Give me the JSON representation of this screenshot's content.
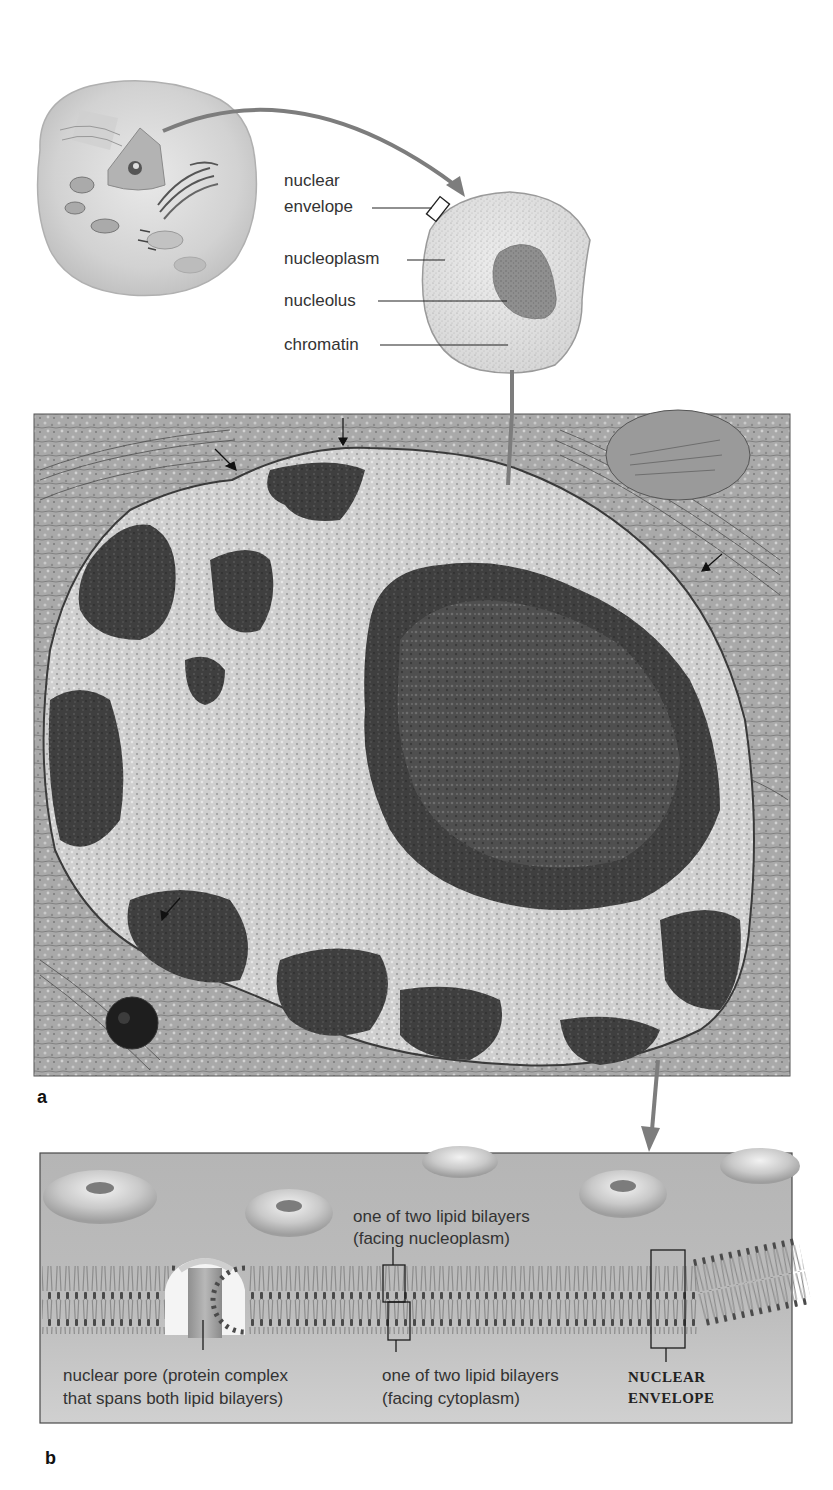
{
  "figure": {
    "panel_a_letter": "a",
    "panel_b_letter": "b",
    "top_diagram": {
      "labels": {
        "nuclear_line1": "nuclear",
        "nuclear_line2": "envelope",
        "nucleoplasm": "nucleoplasm",
        "nucleolus": "nucleolus",
        "chromatin": "chromatin"
      }
    },
    "micrograph": {
      "description": "transmission electron micrograph of cell nucleus"
    },
    "envelope_diagram": {
      "labels": {
        "inner_bilayer_line1": "one of two lipid bilayers",
        "inner_bilayer_line2": "(facing nucleoplasm)",
        "pore_line1": "nuclear pore (protein complex",
        "pore_line2": "that spans both lipid bilayers)",
        "outer_bilayer_line1": "one of two lipid bilayers",
        "outer_bilayer_line2": "(facing cytoplasm)",
        "envelope_line1": "NUCLEAR",
        "envelope_line2": "ENVELOPE"
      }
    },
    "colors": {
      "arrow": "#7a7a7a",
      "leader_line": "#222222",
      "panel_b_bg": "#b9b9b9",
      "micrograph_light": "#c8c8c8",
      "micrograph_dark": "#3a3a3a"
    }
  }
}
